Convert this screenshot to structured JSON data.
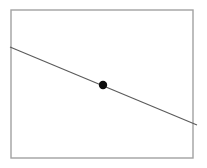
{
  "canvas": {
    "width": 207,
    "height": 168,
    "background_color": "#ffffff"
  },
  "figure": {
    "title": "",
    "caption": "",
    "has_axis_labels": false,
    "has_tick_labels": false,
    "has_legend": false,
    "has_gridlines": false
  },
  "frame": {
    "name": "plot-frame",
    "x": 11,
    "y": 10,
    "width": 182,
    "height": 148,
    "stroke_color": "#a2a2a2",
    "stroke_width": 1.4,
    "fill": "none"
  },
  "chart_data": {
    "type": "line",
    "title": "",
    "xlabel": "",
    "ylabel": "",
    "grid": false,
    "legend": null,
    "xlim": [
      11,
      193
    ],
    "ylim": [
      158,
      10
    ],
    "series": [
      {
        "name": "descending-line",
        "kind": "line",
        "color": "#5a5a5a",
        "stroke_width": 1.1,
        "x": [
          10,
          197
        ],
        "y": [
          47,
          125
        ],
        "slope_px_per_px": 0.417,
        "extends_past_frame": true
      },
      {
        "name": "marked-point",
        "kind": "scatter",
        "color": "#0d0d0d",
        "marker": "filled-circle",
        "marker_radius": 4.2,
        "x": [
          103
        ],
        "y": [
          85
        ]
      }
    ]
  },
  "elements": {
    "line_name": "diagonal-line",
    "point_name": "data-point-marker",
    "frame_name": "plot-border-rect"
  }
}
